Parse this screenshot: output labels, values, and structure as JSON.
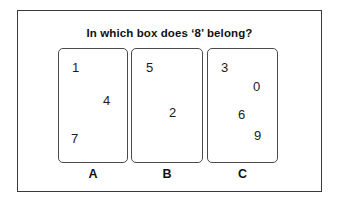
{
  "question": {
    "text": "In which box does ‘8’ belong?"
  },
  "colors": {
    "frame": "#3a3a3a",
    "box_border": "#4a4a4a",
    "text": "#111111",
    "digit": "#1a1a1a",
    "background": "#ffffff"
  },
  "boxes": [
    {
      "label": "A",
      "digits": [
        {
          "value": "1",
          "x": 13,
          "y": 12
        },
        {
          "value": "4",
          "x": 44,
          "y": 45
        },
        {
          "value": "7",
          "x": 12,
          "y": 83
        }
      ]
    },
    {
      "label": "B",
      "digits": [
        {
          "value": "5",
          "x": 14,
          "y": 12
        },
        {
          "value": "2",
          "x": 37,
          "y": 57
        }
      ]
    },
    {
      "label": "C",
      "digits": [
        {
          "value": "3",
          "x": 13,
          "y": 12
        },
        {
          "value": "0",
          "x": 45,
          "y": 31
        },
        {
          "value": "6",
          "x": 30,
          "y": 59
        },
        {
          "value": "9",
          "x": 46,
          "y": 80
        }
      ]
    }
  ]
}
